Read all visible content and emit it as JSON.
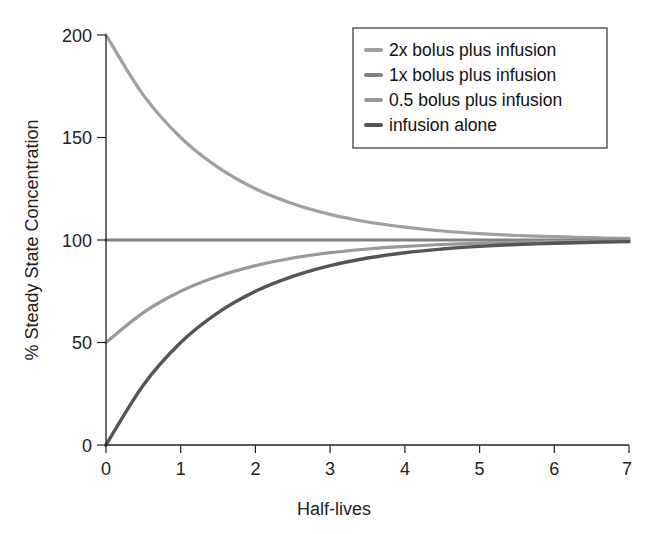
{
  "chart_data": {
    "type": "line",
    "title": "",
    "xlabel": "Half-lives",
    "ylabel": "% Steady State Concentration",
    "xlim": [
      0,
      7
    ],
    "ylim": [
      0,
      200
    ],
    "xticks": [
      0,
      1,
      2,
      3,
      4,
      5,
      6,
      7
    ],
    "yticks": [
      0,
      50,
      100,
      150,
      200
    ],
    "grid": false,
    "legend_position": "upper right",
    "x": [
      0,
      0.5,
      1,
      1.5,
      2,
      2.5,
      3,
      3.5,
      4,
      4.5,
      5,
      5.5,
      6,
      6.5,
      7
    ],
    "series": [
      {
        "name": "2x bolus plus infusion",
        "color": "#a0a0a0",
        "values": [
          200,
          170.7,
          150,
          135.4,
          125,
          117.7,
          112.5,
          108.8,
          106.3,
          104.4,
          103.1,
          102.2,
          101.6,
          101.1,
          100.8
        ]
      },
      {
        "name": "1x bolus plus infusion",
        "color": "#808080",
        "values": [
          100,
          100,
          100,
          100,
          100,
          100,
          100,
          100,
          100,
          100,
          100,
          100,
          100,
          100,
          100
        ]
      },
      {
        "name": "0.5 bolus plus infusion",
        "color": "#999999",
        "values": [
          50,
          64.6,
          75,
          82.3,
          87.5,
          91.2,
          93.8,
          95.6,
          96.9,
          97.8,
          98.4,
          98.9,
          99.2,
          99.4,
          99.6
        ]
      },
      {
        "name": "infusion alone",
        "color": "#555555",
        "values": [
          0,
          29.3,
          50,
          64.6,
          75,
          82.3,
          87.5,
          91.2,
          93.8,
          95.6,
          96.9,
          97.8,
          98.4,
          98.9,
          99.2
        ]
      }
    ]
  },
  "legend": {
    "items": [
      {
        "label": "2x bolus plus infusion",
        "color": "#a0a0a0"
      },
      {
        "label": "1x bolus plus infusion",
        "color": "#808080"
      },
      {
        "label": "0.5 bolus plus infusion",
        "color": "#999999"
      },
      {
        "label": "infusion alone",
        "color": "#555555"
      }
    ]
  },
  "axes": {
    "x_title": "Half-lives",
    "y_title": "% Steady State Concentration",
    "x_tick_labels": [
      "0",
      "1",
      "2",
      "3",
      "4",
      "5",
      "6",
      "7"
    ],
    "y_tick_labels": [
      "0",
      "50",
      "100",
      "150",
      "200"
    ]
  }
}
